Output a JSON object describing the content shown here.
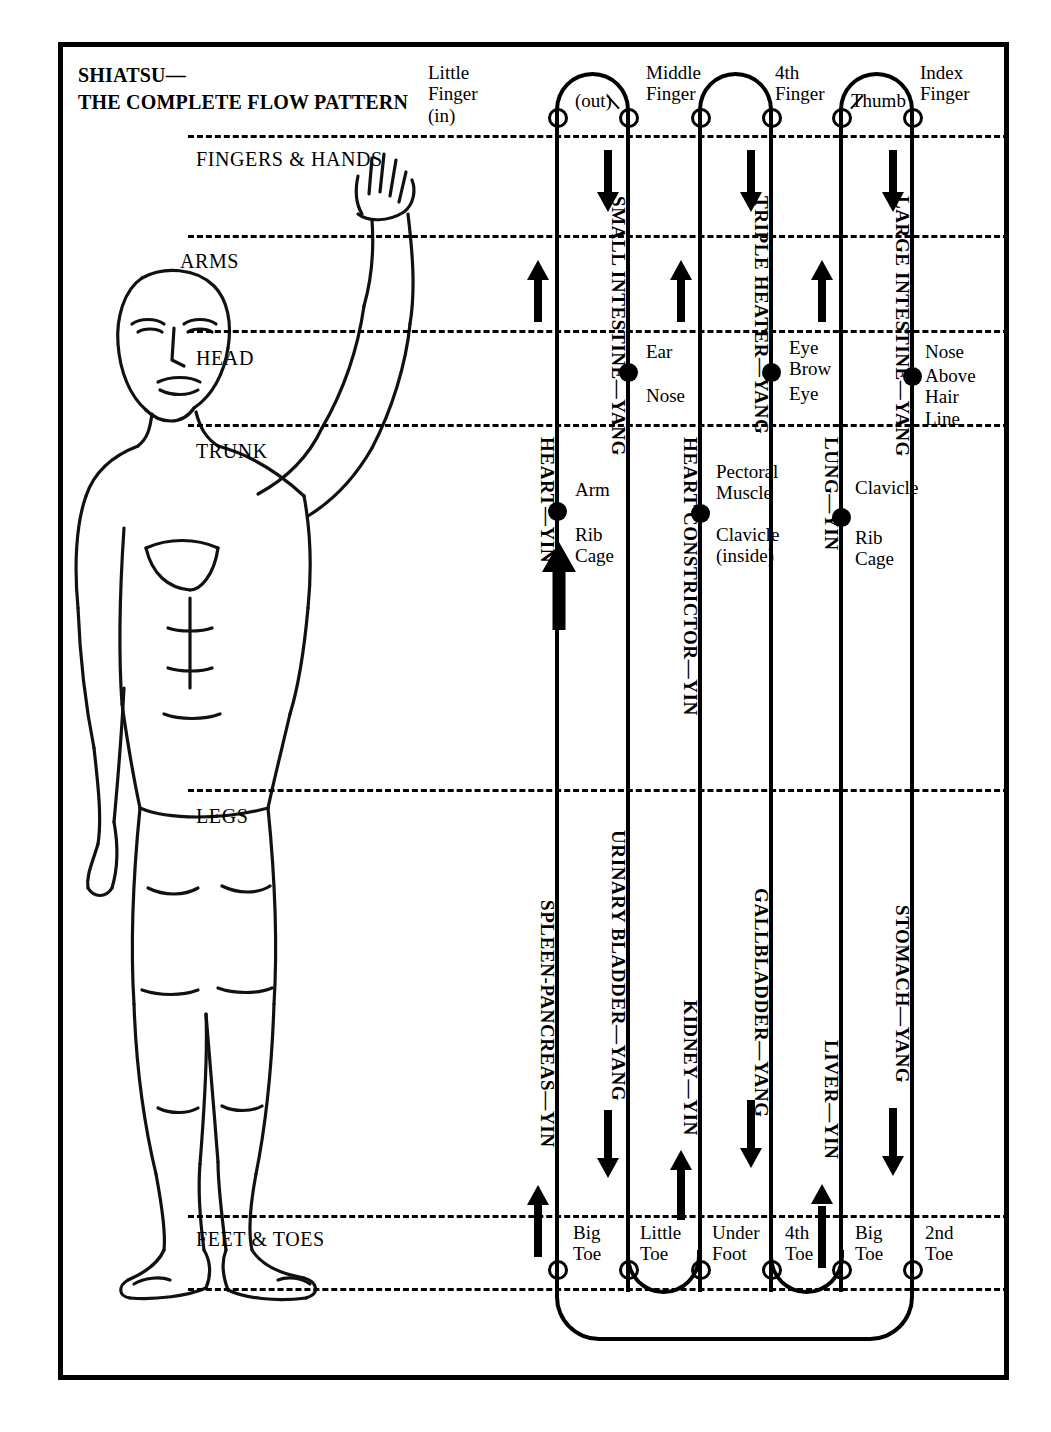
{
  "title": {
    "line1": "SHIATSU—",
    "line2": "THE COMPLETE FLOW PATTERN"
  },
  "bands": [
    {
      "name": "fingers-hands",
      "label": "FINGERS & HANDS"
    },
    {
      "name": "arms",
      "label": "ARMS"
    },
    {
      "name": "head",
      "label": "HEAD"
    },
    {
      "name": "trunk",
      "label": "TRUNK"
    },
    {
      "name": "legs",
      "label": "LEGS"
    },
    {
      "name": "feet-toes",
      "label": "FEET & TOES"
    }
  ],
  "top_terminals": [
    {
      "name": "little-finger-in",
      "label": "Little\nFinger\n(in)"
    },
    {
      "name": "out",
      "label": "(out)"
    },
    {
      "name": "middle-finger",
      "label": "Middle\nFinger"
    },
    {
      "name": "fourth-finger",
      "label": "4th\nFinger"
    },
    {
      "name": "thumb",
      "label": "Thumb"
    },
    {
      "name": "index-finger",
      "label": "Index\nFinger"
    }
  ],
  "bottom_terminals": [
    {
      "name": "big-toe-1",
      "label": "Big\nToe"
    },
    {
      "name": "little-toe",
      "label": "Little\nToe"
    },
    {
      "name": "under-foot",
      "label": "Under\nFoot"
    },
    {
      "name": "fourth-toe",
      "label": "4th\nToe"
    },
    {
      "name": "big-toe-2",
      "label": "Big\nToe"
    },
    {
      "name": "second-toe",
      "label": "2nd\nToe"
    }
  ],
  "meridians": [
    {
      "name": "heart",
      "label": "HEART—YIN",
      "polarity": "yin",
      "region": "arm"
    },
    {
      "name": "small-intestine",
      "label": "SMALL INTESTINE—YANG",
      "polarity": "yang",
      "region": "arm"
    },
    {
      "name": "heart-constrictor",
      "label": "HEART CONSTRICTOR—YIN",
      "polarity": "yin",
      "region": "arm"
    },
    {
      "name": "triple-heater",
      "label": "TRIPLE HEATER—YANG",
      "polarity": "yang",
      "region": "arm"
    },
    {
      "name": "lung",
      "label": "LUNG—YIN",
      "polarity": "yin",
      "region": "arm"
    },
    {
      "name": "large-intestine",
      "label": "LARGE INTESTINE—YANG",
      "polarity": "yang",
      "region": "arm"
    },
    {
      "name": "spleen-pancreas",
      "label": "SPLEEN-PANCREAS—YIN",
      "polarity": "yin",
      "region": "leg"
    },
    {
      "name": "urinary-bladder",
      "label": "URINARY BLADDER—YANG",
      "polarity": "yang",
      "region": "leg"
    },
    {
      "name": "kidney",
      "label": "KIDNEY—YIN",
      "polarity": "yin",
      "region": "leg"
    },
    {
      "name": "gallbladder",
      "label": "GALLBLADDER—YANG",
      "polarity": "yang",
      "region": "leg"
    },
    {
      "name": "liver",
      "label": "LIVER—YIN",
      "polarity": "yin",
      "region": "leg"
    },
    {
      "name": "stomach",
      "label": "STOMACH—YANG",
      "polarity": "yang",
      "region": "leg"
    }
  ],
  "point_labels": [
    {
      "name": "small-intestine-ear",
      "label": "Ear"
    },
    {
      "name": "small-intestine-nose",
      "label": "Nose"
    },
    {
      "name": "heart-arm",
      "label": "Arm"
    },
    {
      "name": "heart-rib-cage",
      "label": "Rib\nCage"
    },
    {
      "name": "triple-heater-eye-brow",
      "label": "Eye\nBrow"
    },
    {
      "name": "triple-heater-eye",
      "label": "Eye"
    },
    {
      "name": "heart-constrictor-pectoral",
      "label": "Pectoral\nMuscle"
    },
    {
      "name": "heart-constrictor-clavicle",
      "label": "Clavicle\n(inside)"
    },
    {
      "name": "large-intestine-nose",
      "label": "Nose"
    },
    {
      "name": "large-intestine-hairline",
      "label": "Above\nHair\nLine"
    },
    {
      "name": "lung-clavicle",
      "label": "Clavicle"
    },
    {
      "name": "lung-rib-cage",
      "label": "Rib\nCage"
    }
  ],
  "colors": {
    "ink": "#000000",
    "paper": "#ffffff"
  }
}
